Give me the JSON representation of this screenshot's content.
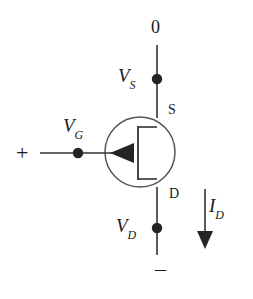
{
  "diagram": {
    "type": "field-effect-transistor-circuit",
    "stroke_color": "#333333",
    "text_color": "#1a1a1a",
    "background_color": "#ffffff"
  },
  "labels": {
    "top_node": "0",
    "source_voltage_var": "V",
    "source_voltage_sub": "S",
    "source_terminal": "S",
    "gate_voltage_var": "V",
    "gate_voltage_sub": "G",
    "plus_sign": "+",
    "drain_terminal": "D",
    "drain_voltage_var": "V",
    "drain_voltage_sub": "D",
    "drain_current_var": "I",
    "drain_current_sub": "D",
    "minus_sign": "–"
  },
  "nodes": [
    {
      "name": "source-node-dot",
      "x": 157,
      "y": 79
    },
    {
      "name": "gate-node-dot",
      "x": 78,
      "y": 153
    },
    {
      "name": "drain-node-dot",
      "x": 157,
      "y": 228
    }
  ],
  "wires": [
    {
      "name": "top-rail",
      "from": [
        157,
        45
      ],
      "to": [
        157,
        118
      ]
    },
    {
      "name": "gate-wire",
      "from": [
        40,
        153
      ],
      "to": [
        112,
        153
      ]
    },
    {
      "name": "bottom-rail",
      "from": [
        157,
        187
      ],
      "to": [
        157,
        255
      ]
    }
  ],
  "transistor": {
    "name": "fet-symbol",
    "circle_center": [
      140,
      152
    ],
    "circle_radius": 35,
    "channel_x": 138,
    "channel_top": 126,
    "channel_bottom": 180,
    "gate_arrow_tip_x": 112,
    "gate_arrow_y": 153
  },
  "current_arrow": {
    "name": "drain-current-arrow",
    "x": 205,
    "from_y": 189,
    "to_y": 246
  }
}
